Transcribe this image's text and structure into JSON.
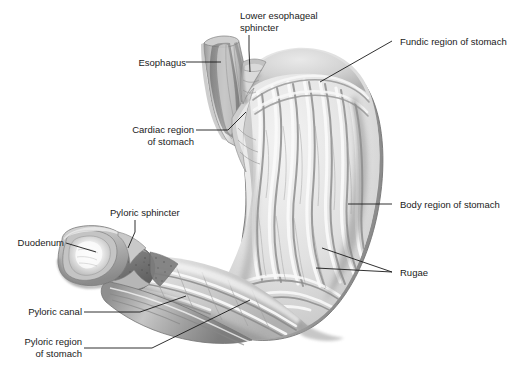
{
  "figure": {
    "background_color": "#ffffff",
    "label_color": "#1a1a1a",
    "leader_line_color": "#1a1a1a",
    "width": 526,
    "height": 379
  },
  "labels": {
    "esophagus": "Esophagus",
    "lower_esophageal_sphincter": "Lower esophageal\nsphincter",
    "fundic_region": "Fundic region of stomach",
    "cardiac_region": "Cardiac region\nof stomach",
    "body_region": "Body region of stomach",
    "rugae": "Rugae",
    "pyloric_sphincter": "Pyloric sphincter",
    "duodenum": "Duodenum",
    "pyloric_canal": "Pyloric canal",
    "pyloric_region": "Pyloric region\nof stomach"
  },
  "structures": [
    {
      "name": "esophagus",
      "label": "Esophagus"
    },
    {
      "name": "lower-esophageal-sphincter",
      "label": "Lower esophageal sphincter"
    },
    {
      "name": "fundic-region",
      "label": "Fundic region of stomach"
    },
    {
      "name": "cardiac-region",
      "label": "Cardiac region of stomach"
    },
    {
      "name": "body-region",
      "label": "Body region of stomach"
    },
    {
      "name": "rugae",
      "label": "Rugae"
    },
    {
      "name": "pyloric-sphincter",
      "label": "Pyloric sphincter"
    },
    {
      "name": "duodenum",
      "label": "Duodenum"
    },
    {
      "name": "pyloric-canal",
      "label": "Pyloric canal"
    },
    {
      "name": "pyloric-region",
      "label": "Pyloric region of stomach"
    }
  ],
  "palette": {
    "tissue_light": "#f2f2f2",
    "tissue_mid": "#d2d2d2",
    "tissue_dark": "#8e8e8e",
    "tissue_shadow": "#6e6e6e",
    "outline": "#7a7a7a",
    "lumen_highlight": "#fbfbfb"
  }
}
